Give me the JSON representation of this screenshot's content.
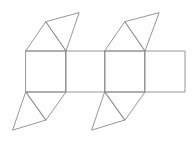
{
  "diagram": {
    "title": "",
    "stroke_color": "#8a8a8a",
    "stroke_width": 0.9,
    "background": "#ffffff",
    "squares": [
      {
        "id": "square-1",
        "points": "26,51 66,51 66,92 26,92"
      },
      {
        "id": "square-2",
        "points": "66,51 105,51 105,92 66,92"
      },
      {
        "id": "square-3",
        "points": "105,51 145,51 145,92 105,92"
      },
      {
        "id": "square-4",
        "points": "145,51 185,51 185,92 145,92"
      }
    ],
    "triangles": [
      {
        "id": "top-1-inner",
        "points": "26,51 66,51 46,22"
      },
      {
        "id": "top-1-outer",
        "points": "46,22 66,51 79,13"
      },
      {
        "id": "top-3-inner",
        "points": "105,51 145,51 125,22"
      },
      {
        "id": "top-3-outer",
        "points": "125,22 145,51 159,13"
      },
      {
        "id": "bottom-1-inner",
        "points": "26,92 66,92 46,120"
      },
      {
        "id": "bottom-1-outer",
        "points": "26,92 46,120 13,130"
      },
      {
        "id": "bottom-3-inner",
        "points": "105,92 145,92 125,120"
      },
      {
        "id": "bottom-3-outer",
        "points": "105,92 125,120 92,130"
      }
    ]
  }
}
